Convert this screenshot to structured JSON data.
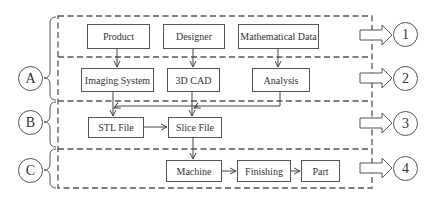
{
  "diagram": {
    "type": "process flowchart",
    "stages": [
      {
        "id": "A",
        "label": "A",
        "rows": [
          "1",
          "2"
        ]
      },
      {
        "id": "B",
        "label": "B",
        "rows": [
          "3"
        ]
      },
      {
        "id": "C",
        "label": "C",
        "rows": [
          "4"
        ]
      }
    ],
    "rows": [
      {
        "id": "1",
        "label": "1",
        "nodes": [
          "Product",
          "Designer",
          "Mathematical Data"
        ]
      },
      {
        "id": "2",
        "label": "2",
        "nodes": [
          "Imaging System",
          "3D CAD",
          "Analysis"
        ]
      },
      {
        "id": "3",
        "label": "3",
        "nodes": [
          "STL File",
          "Slice File"
        ]
      },
      {
        "id": "4",
        "label": "4",
        "nodes": [
          "Machine",
          "Finishing",
          "Part"
        ]
      }
    ],
    "nodes": {
      "product": "Product",
      "designer": "Designer",
      "math_data": "Mathematical Data",
      "imaging": "Imaging System",
      "cad": "3D CAD",
      "analysis": "Analysis",
      "stl": "STL File",
      "slice": "Slice File",
      "machine": "Machine",
      "finishing": "Finishing",
      "part": "Part"
    },
    "edges": [
      [
        "Product",
        "Imaging System"
      ],
      [
        "Designer",
        "3D CAD"
      ],
      [
        "Mathematical Data",
        "Analysis"
      ],
      [
        "Imaging System",
        "STL File"
      ],
      [
        "3D CAD",
        "Slice File"
      ],
      [
        "Analysis",
        "STL File"
      ],
      [
        "Analysis",
        "Slice File"
      ],
      [
        "STL File",
        "Slice File"
      ],
      [
        "Slice File",
        "Machine"
      ],
      [
        "Machine",
        "Finishing"
      ],
      [
        "Finishing",
        "Part"
      ]
    ],
    "left_labels": {
      "a": "A",
      "b": "B",
      "c": "C"
    },
    "right_labels": {
      "r1": "1",
      "r2": "2",
      "r3": "3",
      "r4": "4"
    }
  }
}
